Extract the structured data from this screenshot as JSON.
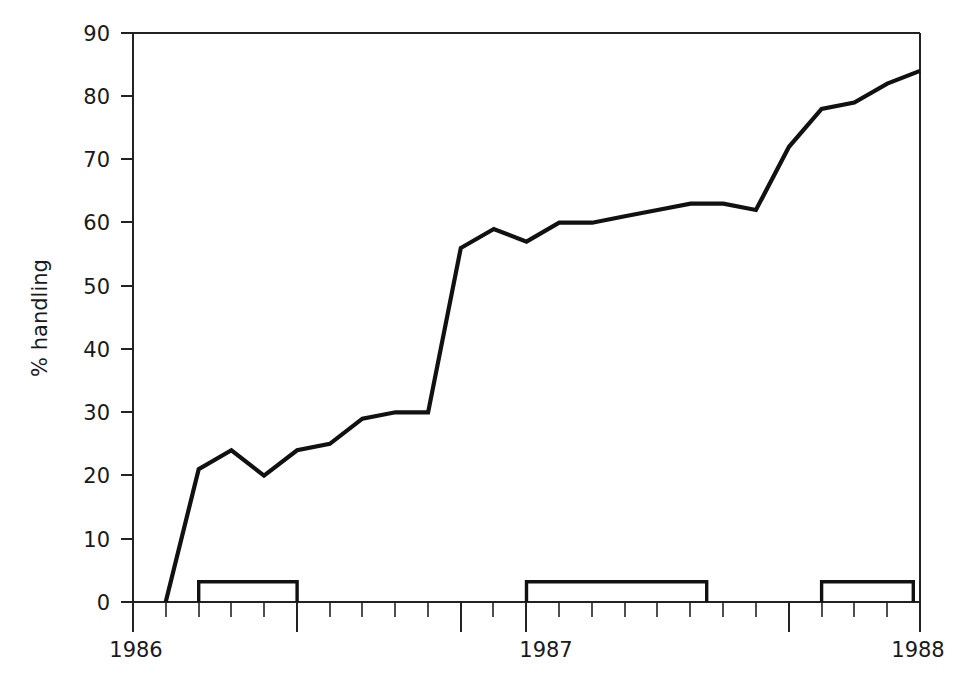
{
  "chart_data": {
    "type": "line",
    "title": "",
    "subtitle": "",
    "xlabel": "",
    "ylabel": "% handling",
    "ylim": [
      0,
      90
    ],
    "xlim": [
      1986.0,
      1988.0
    ],
    "grid": false,
    "legend": null,
    "y_ticks": [
      0,
      10,
      20,
      30,
      40,
      50,
      60,
      70,
      80,
      90
    ],
    "y_tick_labels": [
      "0",
      "10",
      "20",
      "30",
      "40",
      "50",
      "60",
      "70",
      "80",
      "90"
    ],
    "x_tick_labels": [
      "1986",
      "1987",
      "1988"
    ],
    "x_tick_values": [
      1986,
      1987,
      1988
    ],
    "x_minor_tick_interval_months": 1,
    "series": [
      {
        "name": "% handling",
        "x": [
          1986.083,
          1986.167,
          1986.25,
          1986.333,
          1986.417,
          1986.5,
          1986.583,
          1986.667,
          1986.75,
          1986.833,
          1986.917,
          1987.0,
          1987.083,
          1987.167,
          1987.25,
          1987.333,
          1987.417,
          1987.5,
          1987.583,
          1987.667,
          1987.75,
          1987.833,
          1987.917,
          1988.0
        ],
        "values": [
          0,
          21,
          24,
          20,
          24,
          25,
          29,
          30,
          30,
          56,
          59,
          57,
          60,
          60,
          61,
          62,
          63,
          63,
          62,
          72,
          78,
          79,
          82,
          84
        ]
      }
    ],
    "annotations": {
      "brackets_label": "observation periods",
      "brackets_value": 3,
      "brackets": [
        {
          "x_start": 1986.167,
          "x_end": 1986.417,
          "y_top": 3.2
        },
        {
          "x_start": 1987.0,
          "x_end": 1987.458,
          "y_top": 3.2
        },
        {
          "x_start": 1987.75,
          "x_end": 1987.983,
          "y_top": 3.2
        }
      ]
    }
  },
  "axis": {
    "y_label": "% handling",
    "x_labels": {
      "start": "1986",
      "middle": "1987",
      "end": "1988"
    }
  }
}
